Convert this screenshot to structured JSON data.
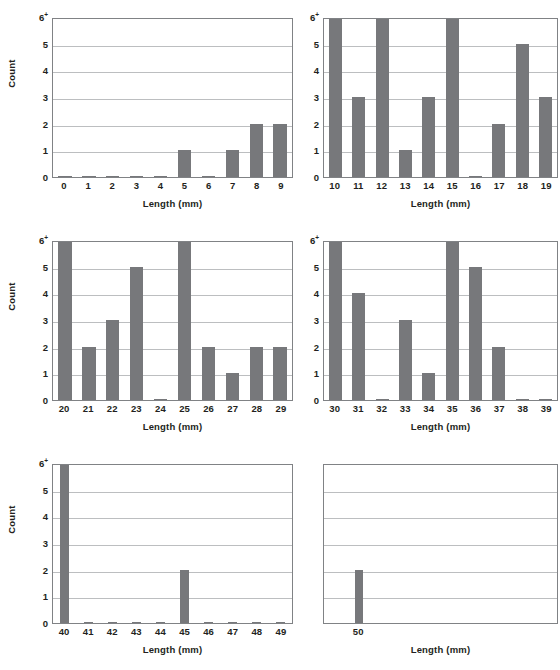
{
  "figure": {
    "axis_titles": {
      "y": "Count",
      "x": "Length (mm)"
    },
    "y_tick_labels": [
      "0",
      "1",
      "2",
      "3",
      "4",
      "5",
      "6"
    ],
    "y_top_suffix": "+",
    "colors": {
      "bar": "#77787b",
      "grid": "#bcbec0",
      "axis": "#808285",
      "text": "#231f20",
      "background": "#ffffff"
    }
  },
  "chart_data": [
    {
      "type": "bar",
      "panel": 1,
      "title": "",
      "xlabel": "Length (mm)",
      "ylabel": "Count",
      "ylim": [
        0,
        6
      ],
      "ytop_label": "6+",
      "grid": true,
      "bar_width": "wide",
      "categories": [
        "0",
        "1",
        "2",
        "3",
        "4",
        "5",
        "6",
        "7",
        "8",
        "9"
      ],
      "values": [
        0,
        0,
        0,
        0,
        0,
        1,
        0,
        1,
        2,
        2
      ]
    },
    {
      "type": "bar",
      "panel": 2,
      "title": "",
      "xlabel": "Length (mm)",
      "ylabel": "",
      "ylim": [
        0,
        6
      ],
      "ytop_label": "6+",
      "grid": true,
      "bar_width": "wide",
      "categories": [
        "10",
        "11",
        "12",
        "13",
        "14",
        "15",
        "16",
        "17",
        "18",
        "19"
      ],
      "values": [
        6,
        3,
        6,
        1,
        3,
        6,
        0,
        2,
        5,
        3
      ]
    },
    {
      "type": "bar",
      "panel": 3,
      "title": "",
      "xlabel": "Length (mm)",
      "ylabel": "Count",
      "ylim": [
        0,
        6
      ],
      "ytop_label": "6+",
      "grid": true,
      "bar_width": "wide",
      "categories": [
        "20",
        "21",
        "22",
        "23",
        "24",
        "25",
        "26",
        "27",
        "28",
        "29"
      ],
      "values": [
        6,
        2,
        3,
        5,
        0,
        6,
        2,
        1,
        2,
        2
      ]
    },
    {
      "type": "bar",
      "panel": 4,
      "title": "",
      "xlabel": "Length (mm)",
      "ylabel": "",
      "ylim": [
        0,
        6
      ],
      "ytop_label": "6+",
      "grid": true,
      "bar_width": "wide",
      "categories": [
        "30",
        "31",
        "32",
        "33",
        "34",
        "35",
        "36",
        "37",
        "38",
        "39"
      ],
      "values": [
        6,
        4,
        0,
        3,
        1,
        6,
        5,
        2,
        0,
        0
      ]
    },
    {
      "type": "bar",
      "panel": 5,
      "title": "",
      "xlabel": "Length (mm)",
      "ylabel": "Count",
      "ylim": [
        0,
        6
      ],
      "ytop_label": "6+",
      "grid": true,
      "bar_width": "narrow",
      "categories": [
        "40",
        "41",
        "42",
        "43",
        "44",
        "45",
        "46",
        "47",
        "48",
        "49"
      ],
      "values": [
        6,
        0,
        0,
        0,
        0,
        2,
        0,
        0,
        0,
        0
      ]
    },
    {
      "type": "bar",
      "panel": 6,
      "title": "",
      "xlabel": "Length (mm)",
      "ylabel": "",
      "ylim": [
        0,
        6
      ],
      "ytop_label": "",
      "grid": true,
      "bar_width": "narrow",
      "categories": [
        "",
        "50",
        "",
        "",
        "",
        "",
        "",
        "",
        "",
        ""
      ],
      "values": [
        0,
        2,
        0,
        0,
        0,
        0,
        0,
        0,
        0,
        0
      ],
      "hide_y_ticks": true,
      "suppress_zero_nubs": true
    }
  ]
}
